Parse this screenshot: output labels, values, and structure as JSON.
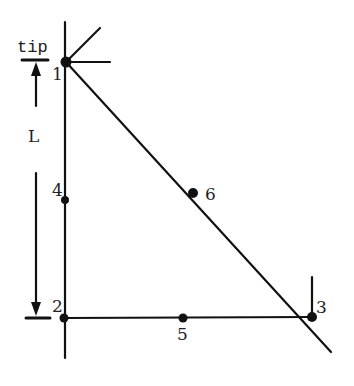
{
  "figure": {
    "tip_label": "tip",
    "length_label": "L",
    "caption_partial": "b) ... elements of ...",
    "line_color": "#111111",
    "nodes": [
      {
        "id": "1",
        "label": "1",
        "x": 66,
        "y": 62
      },
      {
        "id": "2",
        "label": "2",
        "x": 64,
        "y": 318
      },
      {
        "id": "3",
        "label": "3",
        "x": 312,
        "y": 317
      },
      {
        "id": "4",
        "label": "4",
        "x": 65,
        "y": 200
      },
      {
        "id": "5",
        "label": "5",
        "x": 183,
        "y": 318
      },
      {
        "id": "6",
        "label": "6",
        "x": 193,
        "y": 193
      }
    ]
  }
}
